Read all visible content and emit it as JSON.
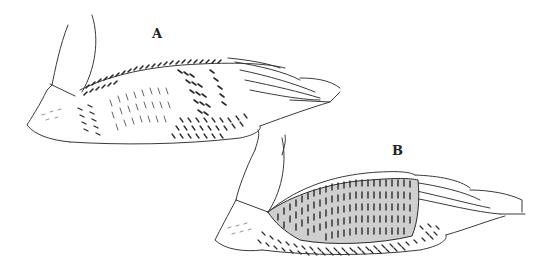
{
  "figure": {
    "panels": [
      {
        "id": "A",
        "label": "A",
        "description": "Bird body with light-patterned flank and barred back"
      },
      {
        "id": "B",
        "label": "B",
        "description": "Bird body with dark densely barred flank"
      }
    ],
    "colors": {
      "ink": "#3a3a3a",
      "background": "#ffffff"
    }
  }
}
